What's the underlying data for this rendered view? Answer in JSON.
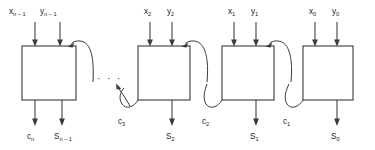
{
  "diagram": {
    "type": "block-diagram",
    "ellipsis": "· · ·",
    "line_color": "#3a3a3a",
    "text_color": "#1d1d1d",
    "background_color": "#ffffff",
    "stages": [
      {
        "id": "stage-n-1",
        "x_label": "x",
        "x_sub": "n – 1",
        "y_label": "y",
        "y_sub": "n – 1",
        "sum_label": "S",
        "sum_sub": "n – 1",
        "carry_out_label": "c",
        "carry_out_sub": "n"
      },
      {
        "id": "stage-2",
        "x_label": "x",
        "x_sub": "2",
        "y_label": "y",
        "y_sub": "2",
        "sum_label": "S",
        "sum_sub": "2",
        "carry_out_label": "c",
        "carry_out_sub": "3"
      },
      {
        "id": "stage-1",
        "x_label": "x",
        "x_sub": "1",
        "y_label": "y",
        "y_sub": "1",
        "sum_label": "S",
        "sum_sub": "1",
        "carry_out_label": "c",
        "carry_out_sub": "2"
      },
      {
        "id": "stage-0",
        "x_label": "x",
        "x_sub": "0",
        "y_label": "y",
        "y_sub": "0",
        "sum_label": "S",
        "sum_sub": "0",
        "carry_out_label": "c",
        "carry_out_sub": "1"
      }
    ]
  }
}
